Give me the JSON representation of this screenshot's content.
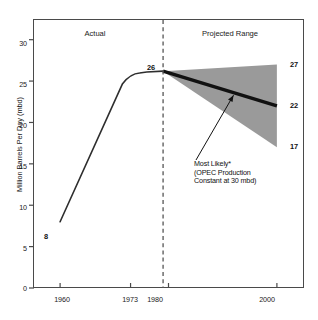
{
  "chart_data": {
    "type": "area",
    "title": "",
    "subtitle": "",
    "xlabel": "",
    "ylabel": "Million Barrels Per Day (mbd)",
    "xlim": [
      1955,
      2005
    ],
    "ylim": [
      0,
      32.5
    ],
    "grid": false,
    "legend_position": "none",
    "x_ticks": [
      "1960",
      "1973",
      "1980",
      "2000"
    ],
    "x_tick_values": [
      1960,
      1973,
      1980,
      2000
    ],
    "y_ticks": [
      "0",
      "5",
      "10",
      "15",
      "20",
      "25",
      "30"
    ],
    "y_tick_values": [
      0,
      5,
      10,
      15,
      20,
      25,
      30
    ],
    "divider_year": 1979,
    "sections": [
      {
        "label": "Actual",
        "x_center": 1966
      },
      {
        "label": "Projected Range",
        "x_center": 1990
      }
    ],
    "series": [
      {
        "name": "Actual",
        "type": "line",
        "x": [
          1960,
          1973,
          1976,
          1979
        ],
        "values": [
          8,
          25.9,
          26.1,
          26.2
        ]
      },
      {
        "name": "Projected High",
        "type": "line",
        "x": [
          1979,
          2000
        ],
        "values": [
          26.2,
          27
        ]
      },
      {
        "name": "Most Likely",
        "type": "line",
        "x": [
          1979,
          2000
        ],
        "values": [
          26.2,
          22
        ]
      },
      {
        "name": "Projected Low",
        "type": "line",
        "x": [
          1979,
          2000
        ],
        "values": [
          26.2,
          17
        ]
      }
    ],
    "point_labels": [
      {
        "text": "8",
        "x": 1960,
        "y": 8
      },
      {
        "text": "26",
        "x": 1979,
        "y": 26.2
      },
      {
        "text": "27",
        "x": 2000,
        "y": 27
      },
      {
        "text": "22",
        "x": 2000,
        "y": 22
      },
      {
        "text": "17",
        "x": 2000,
        "y": 17
      }
    ],
    "annotations": [
      {
        "lines": [
          "Most Likely*",
          "(OPEC Production",
          "Constant at 30 mbd)"
        ],
        "points_to": {
          "x": 1992,
          "y": 23.3
        }
      }
    ],
    "colors": {
      "range_fill": "#9a9a9a",
      "most_likely_line": "#111111",
      "actual_line": "#333333",
      "axis": "#4a4a4a",
      "divider": "#555555",
      "background": "#ffffff"
    }
  },
  "axis": {
    "y_label": "Million Barrels Per Day (mbd)",
    "y_ticks": [
      "30",
      "25",
      "20",
      "15",
      "10",
      "5",
      "0"
    ],
    "x_ticks": [
      "1960",
      "1973",
      "1980",
      "2000"
    ]
  },
  "sections": {
    "actual": "Actual",
    "projected": "Projected Range"
  },
  "labels": {
    "start": "8",
    "peak": "26",
    "high": "27",
    "likely": "22",
    "low": "17"
  },
  "annotation": {
    "line1": "Most Likely*",
    "line2": "(OPEC Production",
    "line3": "Constant at 30 mbd)"
  }
}
